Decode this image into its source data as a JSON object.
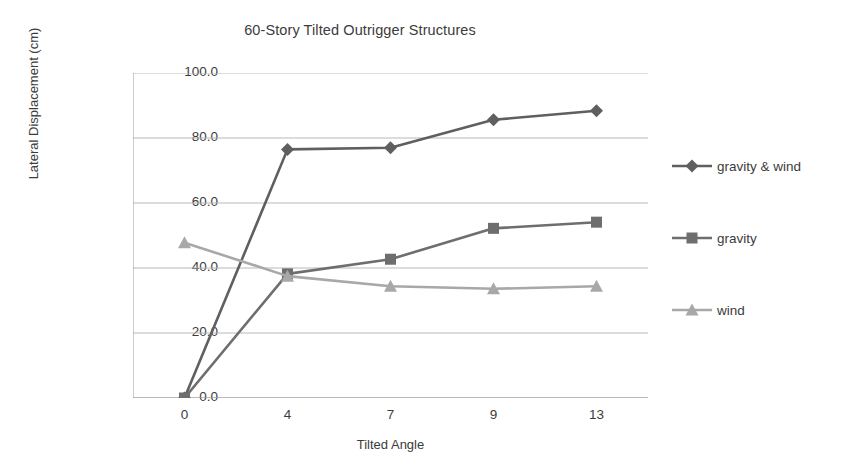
{
  "chart_data": {
    "type": "line",
    "title": "60-Story Tilted Outrigger Structures",
    "xlabel": "Tilted Angle",
    "ylabel": "Lateral Displacement (cm)",
    "categories": [
      "0",
      "4",
      "7",
      "9",
      "13"
    ],
    "x_tick_labels": [
      "0",
      "4",
      "7",
      "9",
      "13"
    ],
    "y_tick_labels": [
      "0.0",
      "20.0",
      "40.0",
      "60.0",
      "80.0",
      "100.0"
    ],
    "y_ticks": [
      0,
      20,
      40,
      60,
      80,
      100
    ],
    "ylim": [
      0,
      100
    ],
    "grid": "horizontal",
    "legend_position": "right",
    "series": [
      {
        "name": "gravity & wind",
        "marker": "diamond",
        "color": "#5f5f5f",
        "values": [
          0.0,
          76.5,
          77.0,
          85.6,
          88.4
        ]
      },
      {
        "name": "gravity",
        "marker": "square",
        "color": "#6e6e6e",
        "values": [
          0.0,
          38.2,
          42.7,
          52.2,
          54.1
        ]
      },
      {
        "name": "wind",
        "marker": "triangle",
        "color": "#a8a8a8",
        "values": [
          47.8,
          37.5,
          34.4,
          33.6,
          34.4
        ]
      }
    ]
  },
  "legend": {
    "items": [
      {
        "label": "gravity & wind",
        "color": "#5f5f5f",
        "marker": "diamond"
      },
      {
        "label": "gravity",
        "color": "#6e6e6e",
        "marker": "square"
      },
      {
        "label": "wind",
        "color": "#a8a8a8",
        "marker": "triangle"
      }
    ]
  },
  "colors": {
    "gravity_and_wind": "#5f5f5f",
    "gravity": "#6e6e6e",
    "wind": "#a8a8a8",
    "grid": "#b9b9b9",
    "axis": "#9a9a9a",
    "text": "#3c3c3c"
  }
}
